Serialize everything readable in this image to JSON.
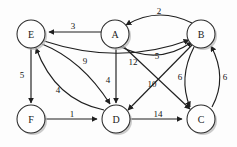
{
  "figure": {
    "kind": "directed-weighted-graph",
    "background_color": "#fdfdfd",
    "stroke_color": "#1f1f1f",
    "node_fill_color": "#fefefe",
    "node_shadow_color": "#b9b9b9",
    "width": 237,
    "height": 147
  },
  "nodes": [
    {
      "id": "E",
      "label": "E",
      "x": 31,
      "y": 34,
      "r": 14
    },
    {
      "id": "A",
      "label": "A",
      "x": 115,
      "y": 34,
      "r": 14
    },
    {
      "id": "B",
      "label": "B",
      "x": 201,
      "y": 34,
      "r": 14
    },
    {
      "id": "F",
      "label": "F",
      "x": 31,
      "y": 119,
      "r": 14
    },
    {
      "id": "D",
      "label": "D",
      "x": 116,
      "y": 119,
      "r": 14
    },
    {
      "id": "C",
      "label": "C",
      "x": 201,
      "y": 119,
      "r": 14
    }
  ],
  "edges": [
    {
      "from": "A",
      "to": "E",
      "weight": "3",
      "label_x": 73,
      "label_y": 28,
      "shape": "straight"
    },
    {
      "from": "B",
      "to": "A",
      "weight": "2",
      "label_x": 159,
      "label_y": 11,
      "shape": "arc-up"
    },
    {
      "from": "A",
      "to": "B",
      "weight": "5",
      "label_x": 157,
      "label_y": 56,
      "shape": "arc-down"
    },
    {
      "from": "E",
      "to": "D",
      "weight": "9",
      "label_x": 85,
      "label_y": 62,
      "shape": "curve"
    },
    {
      "from": "D",
      "to": "E",
      "weight": "4",
      "label_x": 58,
      "label_y": 91,
      "shape": "curve"
    },
    {
      "from": "E",
      "to": "F",
      "weight": "5",
      "label_x": 23,
      "label_y": 76,
      "shape": "straight"
    },
    {
      "from": "A",
      "to": "D",
      "weight": "4",
      "label_x": 108,
      "label_y": 80,
      "shape": "straight"
    },
    {
      "from": "A",
      "to": "C",
      "weight": "12",
      "label_x": 133,
      "label_y": 62,
      "shape": "straight"
    },
    {
      "from": "B",
      "to": "D",
      "weight": "10",
      "label_x": 152,
      "label_y": 84,
      "shape": "straight"
    },
    {
      "from": "E",
      "to": "B",
      "weight": "",
      "label_x": 0,
      "label_y": 0,
      "shape": "long-curve"
    },
    {
      "from": "B",
      "to": "C",
      "weight": "6",
      "label_x": 180,
      "label_y": 77,
      "shape": "arc-left"
    },
    {
      "from": "C",
      "to": "B",
      "weight": "6",
      "label_x": 225,
      "label_y": 77,
      "shape": "arc-right"
    },
    {
      "from": "F",
      "to": "D",
      "weight": "1",
      "label_x": 73,
      "label_y": 114,
      "shape": "straight"
    },
    {
      "from": "D",
      "to": "C",
      "weight": "14",
      "label_x": 159,
      "label_y": 114,
      "shape": "straight"
    }
  ],
  "weights_visible": [
    "3",
    "2",
    "5",
    "9",
    "4",
    "5",
    "4",
    "12",
    "10",
    "6",
    "6",
    "1",
    "14"
  ]
}
